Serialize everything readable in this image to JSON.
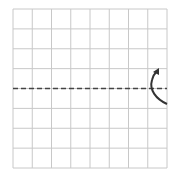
{
  "diagram": {
    "type": "grid-fold",
    "grid": {
      "rows": 8,
      "cols": 8,
      "line_color": "#c8c8c8",
      "x0": 13,
      "y0": 9,
      "x1": 167,
      "y1": 168
    },
    "fold_line": {
      "style": "dashed",
      "orientation": "horizontal",
      "row_position": 4,
      "color": "#444444"
    },
    "fold_arrow": {
      "direction": "upward",
      "side": "right",
      "color": "#333333"
    }
  }
}
